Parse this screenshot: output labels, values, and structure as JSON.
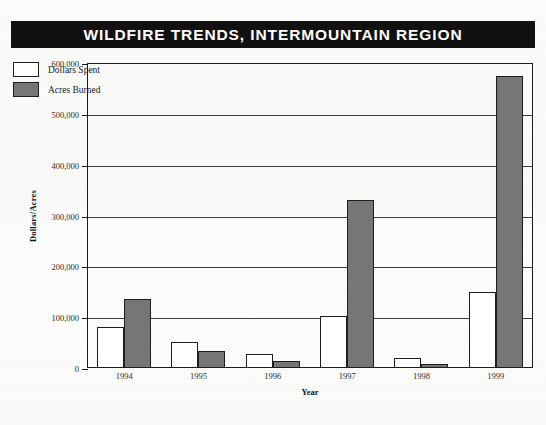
{
  "title": "WILDFIRE TRENDS, INTERMOUNTAIN REGION",
  "legend": {
    "items": [
      {
        "label": "Dollars Spent",
        "swatch": "white-square-icon",
        "color": "#ffffff"
      },
      {
        "label": "Acres Burned",
        "swatch": "gray-square-icon",
        "color": "#767676"
      }
    ]
  },
  "axes": {
    "y_title": "Dollars/Acres",
    "x_title": "Year",
    "y_ticks": [
      "600,000",
      "500,000",
      "400,000",
      "300,000",
      "200,000",
      "100,000",
      "0"
    ]
  },
  "chart_data": {
    "type": "bar",
    "title": "WILDFIRE TRENDS, INTERMOUNTAIN REGION",
    "xlabel": "Year",
    "ylabel": "Dollars/Acres",
    "categories": [
      "1994",
      "1995",
      "1996",
      "1997",
      "1998",
      "1999"
    ],
    "ylim": [
      0,
      600000
    ],
    "ytick_values": [
      0,
      100000,
      200000,
      300000,
      400000,
      500000,
      600000
    ],
    "ytick_labels": [
      "0",
      "100,000",
      "200,000",
      "300,000",
      "400,000",
      "500,000",
      "600,000"
    ],
    "grid": true,
    "grid_axis": "y",
    "legend_position": "top-left-inside",
    "series": [
      {
        "name": "Dollars Spent",
        "color": "#ffffff",
        "edge_color": "#1d1d1d",
        "values": [
          80000,
          52000,
          28000,
          103000,
          19000,
          150000
        ]
      },
      {
        "name": "Acres Burned",
        "color": "#767676",
        "edge_color": "#1d1d1d",
        "values": [
          136000,
          33000,
          14000,
          330000,
          7000,
          575000
        ]
      }
    ]
  }
}
